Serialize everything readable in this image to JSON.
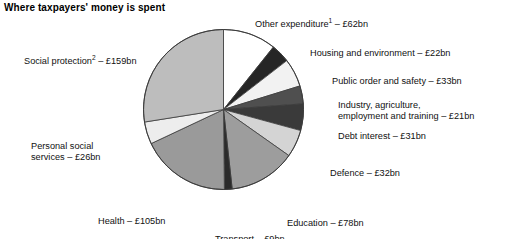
{
  "title": "Where taxpayers' money is spent",
  "chart_data": {
    "type": "pie",
    "title": "Where taxpayers' money is spent",
    "unit": "£bn",
    "total": 570,
    "start_angle_deg": 0,
    "direction": "clockwise",
    "legend": "none-labels-around-pie",
    "grid": false,
    "categories": [
      "Other expenditure",
      "Housing and environment",
      "Public order and safety",
      "Industry, agriculture, employment and training",
      "Debt interest",
      "Defence",
      "Education",
      "Transport",
      "Health",
      "Personal social services",
      "Social protection"
    ],
    "values": [
      62,
      22,
      33,
      21,
      31,
      32,
      78,
      9,
      105,
      26,
      159
    ],
    "slices": [
      {
        "label": "Other expenditure",
        "label_suffix": "1",
        "value": 62,
        "value_text": "£62bn",
        "color": "#ffffff"
      },
      {
        "label": "Housing and environment",
        "label_suffix": "",
        "value": 22,
        "value_text": "£22bn",
        "color": "#262626"
      },
      {
        "label": "Public order and safety",
        "label_suffix": "",
        "value": 33,
        "value_text": "£33bn",
        "color": "#f2f2f2"
      },
      {
        "label": "Industry, agriculture,",
        "label_suffix": "",
        "value": 21,
        "value_text": "£21bn",
        "color": "#4f4f4f",
        "label_line2": "employment and training"
      },
      {
        "label": "Debt interest",
        "label_suffix": "",
        "value": 31,
        "value_text": "£31bn",
        "color": "#3a3a3a"
      },
      {
        "label": "Defence",
        "label_suffix": "",
        "value": 32,
        "value_text": "£32bn",
        "color": "#d4d4d4"
      },
      {
        "label": "Education",
        "label_suffix": "",
        "value": 78,
        "value_text": "£78bn",
        "color": "#9d9d9d"
      },
      {
        "label": "Transport",
        "label_suffix": "",
        "value": 9,
        "value_text": "£9bn",
        "color": "#2b2b2b"
      },
      {
        "label": "Health",
        "label_suffix": "",
        "value": 105,
        "value_text": "£105bn",
        "color": "#9a9a9a"
      },
      {
        "label": "Personal social services",
        "label_suffix": "",
        "value": 26,
        "value_text": "£26bn",
        "color": "#ededed"
      },
      {
        "label": "Social protection",
        "label_suffix": "2",
        "value": 159,
        "value_text": "£159bn",
        "color": "#bdbdbd"
      }
    ]
  },
  "labels": {
    "other": {
      "text": "Other expenditure",
      "sup": "1",
      "amount": "– £62bn"
    },
    "housing": {
      "text": "Housing and environment – £22bn"
    },
    "order": {
      "text": "Public order and safety – £33bn"
    },
    "industry": {
      "line1": "Industry, agriculture,",
      "line2": "employment and training – £21bn"
    },
    "debt": {
      "text": "Debt interest – £31bn"
    },
    "defence": {
      "text": "Defence – £32bn"
    },
    "education": {
      "text": "Education – £78bn"
    },
    "transport": {
      "text": "Transport – £9bn"
    },
    "health": {
      "text": "Health – £105bn"
    },
    "pss": {
      "line1": "Personal social",
      "line2": "services – £26bn"
    },
    "social": {
      "text": "Social protection",
      "sup": "2",
      "amount": "– £159bn"
    }
  },
  "style": {
    "stroke": "#3c3c3c",
    "background": "#ffffff"
  }
}
